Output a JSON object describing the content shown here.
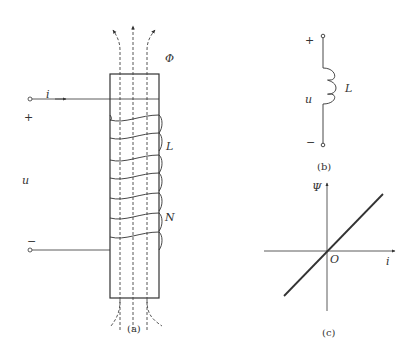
{
  "figure_a": {
    "caption": "(a)",
    "labels": {
      "current": "i",
      "plus": "+",
      "voltage": "u",
      "minus": "−",
      "flux": "Φ",
      "inductance": "L",
      "turns": "N"
    },
    "winding_count": 7
  },
  "figure_b": {
    "caption": "(b)",
    "labels": {
      "plus": "+",
      "voltage": "u",
      "minus": "−",
      "inductance": "L"
    }
  },
  "figure_c": {
    "caption": "(c)",
    "labels": {
      "y_axis": "Ψ",
      "x_axis": "i",
      "origin": "O"
    }
  },
  "colors": {
    "line": "#333333",
    "background": "#ffffff"
  }
}
